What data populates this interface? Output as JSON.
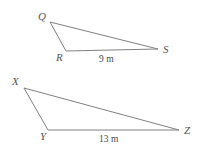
{
  "figure": {
    "background_color": "#ffffff",
    "stroke_color": "#808080",
    "label_color": "#555555",
    "triangles": [
      {
        "name": "triangle-QRS",
        "vertices": [
          {
            "label": "Q",
            "x": 50,
            "y": 22
          },
          {
            "label": "R",
            "x": 66,
            "y": 51
          },
          {
            "label": "S",
            "x": 158,
            "y": 49
          }
        ],
        "side_labels": [
          {
            "text": "9 m",
            "side": "RS"
          }
        ]
      },
      {
        "name": "triangle-XYZ",
        "vertices": [
          {
            "label": "X",
            "x": 24,
            "y": 88
          },
          {
            "label": "Y",
            "x": 48,
            "y": 130
          },
          {
            "label": "Z",
            "x": 179,
            "y": 130
          }
        ],
        "side_labels": [
          {
            "text": "13 m",
            "side": "YZ"
          }
        ]
      }
    ]
  },
  "labels": {
    "Q": "Q",
    "R": "R",
    "S": "S",
    "X": "X",
    "Y": "Y",
    "Z": "Z",
    "side_9m": "9 m",
    "side_13m": "13 m"
  }
}
